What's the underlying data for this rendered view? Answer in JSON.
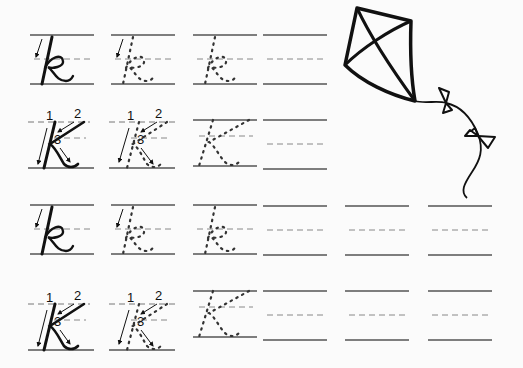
{
  "worksheet": {
    "title": "Cursive letter K handwriting practice",
    "letter_lower": "k",
    "letter_upper": "K",
    "stroke_numbers": [
      "1",
      "2",
      "3"
    ],
    "colors": {
      "ink": "#111111",
      "guide_solid": "#555555",
      "guide_dashed": "#888888",
      "paper": "#fbfbfb"
    }
  },
  "sections": [
    {
      "name": "top-practice",
      "rows": [
        {
          "type": "lowercase",
          "cells": [
            "model-with-arrow",
            "dotted-with-arrow",
            "dotted",
            "blank"
          ]
        },
        {
          "type": "uppercase",
          "cells": [
            "model-with-arrows",
            "dotted-with-arrows",
            "dotted",
            "blank"
          ]
        }
      ]
    },
    {
      "name": "bottom-practice",
      "rows": [
        {
          "type": "lowercase",
          "cells": [
            "model-with-arrow",
            "dotted-with-arrow",
            "dotted",
            "blank",
            "blank",
            "blank"
          ]
        },
        {
          "type": "uppercase",
          "cells": [
            "model-with-arrows",
            "dotted-with-arrows",
            "dotted",
            "blank",
            "blank",
            "blank"
          ]
        }
      ]
    }
  ],
  "illustration": {
    "name": "kite",
    "bows": 2
  }
}
